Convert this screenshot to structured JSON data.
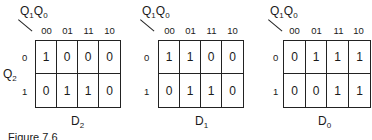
{
  "col_variable": {
    "main": "Q",
    "a_sub": "1",
    "b_main": "Q",
    "b_sub": "0"
  },
  "row_variable": {
    "main": "Q",
    "sub": "2"
  },
  "column_codes": [
    "00",
    "01",
    "11",
    "10"
  ],
  "row_codes": [
    "0",
    "1"
  ],
  "maps": [
    {
      "name_main": "D",
      "name_sub": "2",
      "rows": [
        [
          "1",
          "0",
          "0",
          "0"
        ],
        [
          "0",
          "1",
          "1",
          "0"
        ]
      ]
    },
    {
      "name_main": "D",
      "name_sub": "1",
      "rows": [
        [
          "1",
          "1",
          "0",
          "0"
        ],
        [
          "0",
          "1",
          "1",
          "0"
        ]
      ]
    },
    {
      "name_main": "D",
      "name_sub": "0",
      "rows": [
        [
          "0",
          "1",
          "1",
          "1"
        ],
        [
          "0",
          "0",
          "1",
          "1"
        ]
      ]
    }
  ],
  "caption": "Figure 7.6"
}
